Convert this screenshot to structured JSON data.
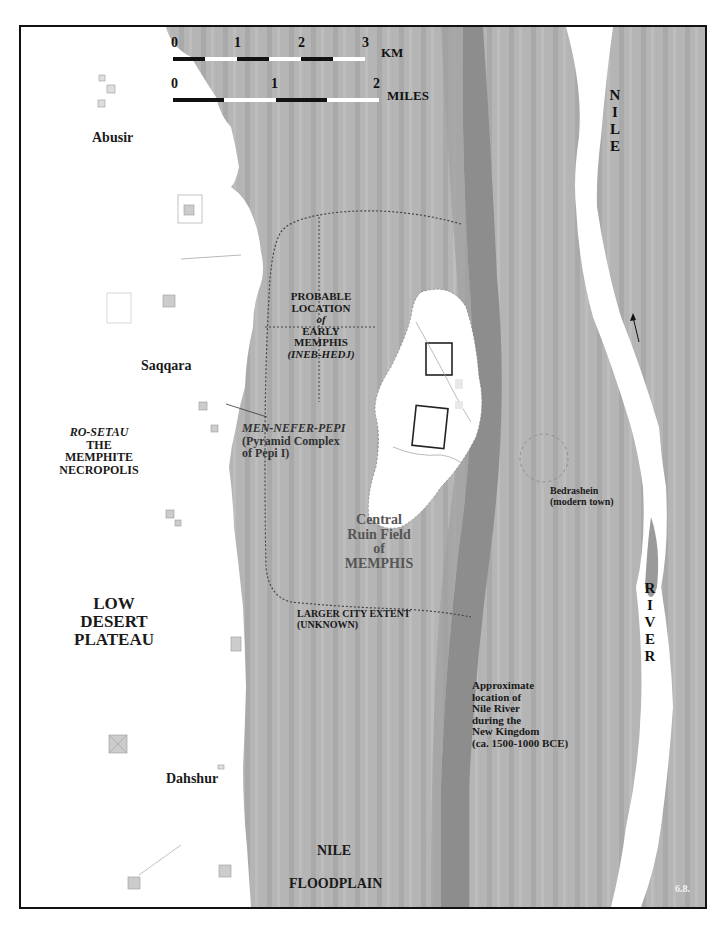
{
  "map": {
    "figure_number": "6.8.",
    "colors": {
      "floodplain": "#b3b3b3",
      "floodplain_stripe": "#a6a6a6",
      "ancient_channel": "#8f8f8f",
      "desert": "#ffffff",
      "river": "#ffffff",
      "frame": "#111111",
      "label": "#1a1a1a",
      "ruin_label": "#555555"
    },
    "scale_bars": {
      "km": {
        "ticks": [
          "0",
          "1",
          "2",
          "3"
        ],
        "unit": "KM"
      },
      "miles": {
        "ticks": [
          "0",
          "1",
          "2"
        ],
        "unit": "MILES"
      }
    },
    "river_label": {
      "top": [
        "N",
        "I",
        "L",
        "E"
      ],
      "bottom": [
        "R",
        "I",
        "V",
        "E",
        "R"
      ]
    },
    "labels": {
      "abusir": "Abusir",
      "saqqara": "Saqqara",
      "dahshur": "Dahshur",
      "ro_setau": "RO-SETAU",
      "necropolis": [
        "THE",
        "MEMPHITE",
        "NECROPOLIS"
      ],
      "low_desert": [
        "LOW",
        "DESERT",
        "PLATEAU"
      ],
      "probable_location": [
        "PROBABLE",
        "LOCATION",
        "of",
        "EARLY",
        "MEMPHIS"
      ],
      "ineb_hedj": "(INEB-HEDJ)",
      "men_nefer_pepi": "MEN-NEFER-PEPI",
      "pyramid_complex": [
        "(Pyramid Complex",
        "of Pepi I)"
      ],
      "central_ruin": [
        "Central",
        "Ruin Field",
        "of",
        "MEMPHIS"
      ],
      "bedrashein": [
        "Bedrashein",
        "(modern town)"
      ],
      "larger_city": [
        "LARGER CITY EXTENT",
        "(UNKNOWN)"
      ],
      "ancient_nile": [
        "Approximate",
        "location of",
        "Nile River",
        "during the",
        "New Kingdom",
        "(ca. 1500-1000 BCE)"
      ],
      "nile_floodplain": [
        "NILE",
        "FLOODPLAIN"
      ]
    }
  }
}
